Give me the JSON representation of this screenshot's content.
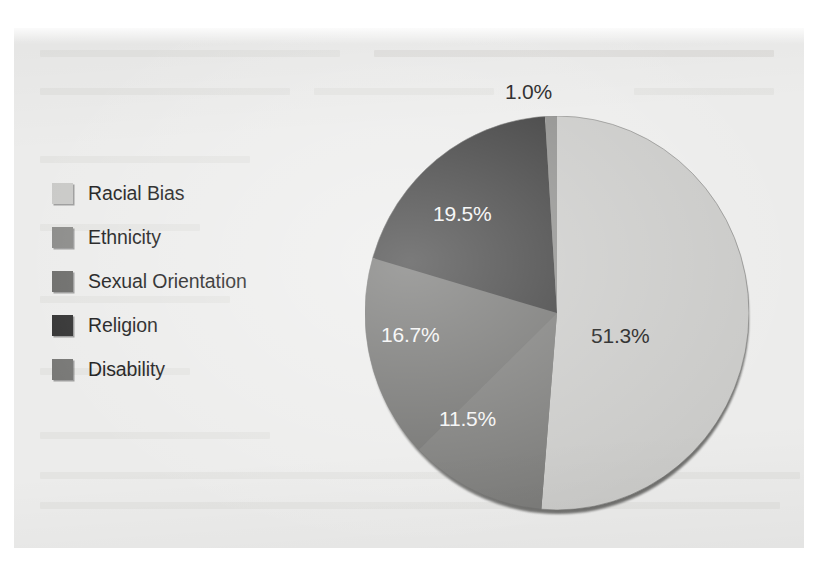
{
  "figure": {
    "background_color": "#ececeb",
    "paper_color": "#ffffff"
  },
  "legend": {
    "position": "left",
    "items": [
      {
        "label": "Racial Bias",
        "color": "#c9c9c7",
        "swatch_name": "legend-swatch-racial-bias"
      },
      {
        "label": "Ethnicity",
        "color": "#8b8b89",
        "swatch_name": "legend-swatch-ethnicity"
      },
      {
        "label": "Sexual Orientation",
        "color": "#6d6d6b",
        "swatch_name": "legend-swatch-sexual-orientation"
      },
      {
        "label": "Religion",
        "color": "#343434",
        "swatch_name": "legend-swatch-religion"
      },
      {
        "label": "Disability",
        "color": "#777775",
        "swatch_name": "legend-swatch-disability"
      }
    ]
  },
  "labels": {
    "ethnicity_pct": "1.0%",
    "religion_pct": "19.5%",
    "sexual_orientation_pct": "16.7%",
    "disability_pct": "11.5%",
    "racial_bias_pct": "51.3%"
  },
  "chart_data": {
    "type": "pie",
    "title": "",
    "subtitle": "",
    "xlabel": "",
    "ylabel": "",
    "grid": false,
    "legend_position": "left",
    "units": "percent",
    "start_angle_deg": 0,
    "direction": "clockwise",
    "categories": [
      "Racial Bias",
      "Ethnicity",
      "Sexual Orientation",
      "Religion",
      "Disability"
    ],
    "values": [
      51.3,
      1.0,
      16.7,
      19.5,
      11.5
    ],
    "colors": [
      "#c9c9c7",
      "#8b8b89",
      "#6d6d6b",
      "#343434",
      "#777775"
    ],
    "data_labels": [
      "51.3%",
      "1.0%",
      "16.7%",
      "19.5%",
      "11.5%"
    ],
    "slices": [
      {
        "name": "Racial Bias",
        "value": 51.3,
        "label": "51.3%",
        "color": "#c9c9c7",
        "label_color": "#141414",
        "label_inside": true
      },
      {
        "name": "Disability",
        "value": 11.5,
        "label": "11.5%",
        "color": "#777775",
        "label_color": "#f4f4f4",
        "label_inside": true
      },
      {
        "name": "Sexual Orientation",
        "value": 16.7,
        "label": "16.7%",
        "color": "#6d6d6b",
        "label_color": "#f4f4f4",
        "label_inside": true
      },
      {
        "name": "Religion",
        "value": 19.5,
        "label": "19.5%",
        "color": "#343434",
        "label_color": "#f4f4f4",
        "label_inside": true
      },
      {
        "name": "Ethnicity",
        "value": 1.0,
        "label": "1.0%",
        "color": "#8b8b89",
        "label_color": "#141414",
        "label_inside": false
      }
    ],
    "total": 100.0
  }
}
